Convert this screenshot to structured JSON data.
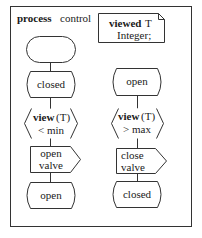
{
  "diagram": {
    "type": "SDL process diagram",
    "header": {
      "keyword": "process",
      "name": "control"
    },
    "declaration": {
      "keyword": "viewed",
      "variable": "T",
      "type": "Integer;"
    },
    "left_branch": {
      "state": "closed",
      "input": {
        "keyword": "view",
        "arg": "(T)",
        "condition": "< min"
      },
      "output": {
        "line1": "open",
        "line2": "valve"
      },
      "next_state": "open"
    },
    "right_branch": {
      "state": "open",
      "input": {
        "keyword": "view",
        "arg": "(T)",
        "condition": "> max"
      },
      "output": {
        "line1": "close",
        "line2": "valve"
      },
      "next_state": "closed"
    },
    "colors": {
      "stroke": "#333333",
      "background": "#ffffff",
      "text": "#1a1a1a"
    }
  }
}
